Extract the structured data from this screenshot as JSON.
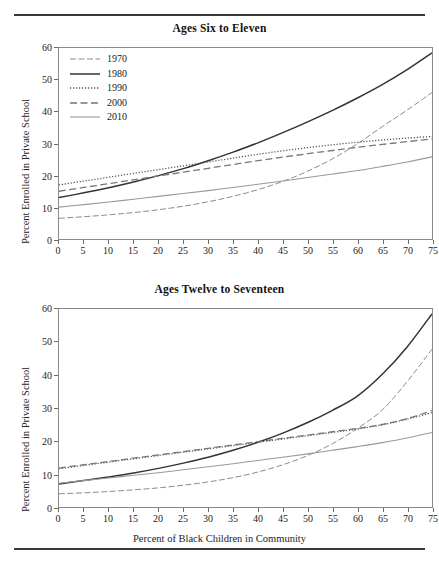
{
  "figure": {
    "ylabel": "Percent Enrolled in Private School",
    "xlabel": "Percent of Black Children in Community",
    "yticks": [
      "0",
      "10",
      "20",
      "30",
      "40",
      "50",
      "60"
    ],
    "xticks": [
      "0",
      "5",
      "10",
      "15",
      "20",
      "25",
      "30",
      "35",
      "40",
      "45",
      "50",
      "55",
      "60",
      "65",
      "70",
      "75"
    ]
  },
  "legend": {
    "items": [
      {
        "label": "1970",
        "style": "dash-dot",
        "color": "#8a8a8a"
      },
      {
        "label": "1980",
        "style": "solid",
        "color": "#333333"
      },
      {
        "label": "1990",
        "style": "dotted",
        "color": "#555555"
      },
      {
        "label": "2000",
        "style": "dashed",
        "color": "#777777"
      },
      {
        "label": "2010",
        "style": "solid-light",
        "color": "#9a9a9a"
      }
    ]
  },
  "chart_data": [
    {
      "id": "ages-six-to-eleven",
      "type": "line",
      "title": "Ages Six to Eleven",
      "xlabel": "",
      "ylabel": "Percent Enrolled in Private School",
      "xlim": [
        0,
        75
      ],
      "ylim": [
        0,
        60
      ],
      "grid": false,
      "legend_position": "upper-left-inside",
      "x": [
        0,
        5,
        10,
        15,
        20,
        25,
        30,
        35,
        40,
        45,
        50,
        55,
        60,
        65,
        70,
        75
      ],
      "series": [
        {
          "name": "1970",
          "style": "dash-dot",
          "color": "#8a8a8a",
          "values": [
            6.5,
            7.0,
            7.6,
            8.3,
            9.2,
            10.3,
            11.7,
            13.4,
            15.5,
            18.1,
            21.3,
            25.2,
            29.9,
            35.3,
            40.5,
            46.0
          ]
        },
        {
          "name": "1980",
          "style": "solid",
          "color": "#333333",
          "values": [
            13.0,
            14.5,
            16.1,
            17.9,
            19.9,
            22.1,
            24.6,
            27.3,
            30.2,
            33.4,
            36.8,
            40.4,
            44.3,
            48.5,
            53.2,
            58.5
          ]
        },
        {
          "name": "1990",
          "style": "dotted",
          "color": "#555555",
          "values": [
            17.0,
            18.2,
            19.4,
            20.6,
            21.8,
            23.0,
            24.2,
            25.4,
            26.6,
            27.7,
            28.7,
            29.6,
            30.4,
            31.1,
            31.7,
            32.2
          ]
        },
        {
          "name": "2000",
          "style": "dashed",
          "color": "#777777",
          "values": [
            15.0,
            16.2,
            17.4,
            18.6,
            19.8,
            21.0,
            22.2,
            23.4,
            24.6,
            25.7,
            26.8,
            27.8,
            28.8,
            29.7,
            30.6,
            31.4
          ]
        },
        {
          "name": "2010",
          "style": "solid-light",
          "color": "#9a9a9a",
          "values": [
            10.0,
            10.8,
            11.6,
            12.5,
            13.4,
            14.3,
            15.2,
            16.2,
            17.2,
            18.2,
            19.3,
            20.4,
            21.5,
            22.8,
            24.2,
            25.8
          ]
        }
      ]
    },
    {
      "id": "ages-twelve-to-seventeen",
      "type": "line",
      "title": "Ages Twelve to Seventeen",
      "xlabel": "Percent of Black Children in Community",
      "ylabel": "Percent Enrolled in Private School",
      "xlim": [
        0,
        75
      ],
      "ylim": [
        0,
        60
      ],
      "grid": false,
      "legend_position": "none",
      "x": [
        0,
        5,
        10,
        15,
        20,
        25,
        30,
        35,
        40,
        45,
        50,
        55,
        60,
        65,
        70,
        75
      ],
      "series": [
        {
          "name": "1970",
          "style": "dash-dot",
          "color": "#8a8a8a",
          "values": [
            4.0,
            4.3,
            4.7,
            5.2,
            5.8,
            6.6,
            7.6,
            8.9,
            10.6,
            12.8,
            15.6,
            19.2,
            23.8,
            29.4,
            38.0,
            47.8
          ]
        },
        {
          "name": "1980",
          "style": "solid",
          "color": "#333333",
          "values": [
            7.0,
            8.0,
            9.1,
            10.3,
            11.7,
            13.3,
            15.1,
            17.2,
            19.6,
            22.4,
            25.6,
            29.3,
            33.6,
            40.2,
            48.5,
            58.5
          ]
        },
        {
          "name": "1990",
          "style": "dotted",
          "color": "#555555",
          "values": [
            11.6,
            12.6,
            13.6,
            14.6,
            15.6,
            16.6,
            17.6,
            18.6,
            19.6,
            20.6,
            21.6,
            22.6,
            23.6,
            24.9,
            26.6,
            28.6
          ]
        },
        {
          "name": "2000",
          "style": "dashed",
          "color": "#777777",
          "values": [
            11.8,
            12.8,
            13.8,
            14.8,
            15.8,
            16.8,
            17.8,
            18.8,
            19.8,
            20.8,
            21.8,
            22.8,
            23.8,
            25.0,
            26.8,
            29.2
          ]
        },
        {
          "name": "2010",
          "style": "solid-light",
          "color": "#9a9a9a",
          "values": [
            7.2,
            8.0,
            8.8,
            9.6,
            10.4,
            11.3,
            12.2,
            13.1,
            14.1,
            15.1,
            16.1,
            17.2,
            18.3,
            19.5,
            20.9,
            22.6
          ]
        }
      ]
    }
  ]
}
